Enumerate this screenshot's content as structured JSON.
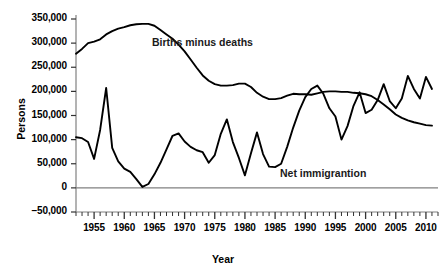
{
  "chart_data": {
    "type": "line",
    "title": "",
    "xlabel": "Year",
    "ylabel": "Persons",
    "xlim": [
      1952,
      2012
    ],
    "ylim": [
      -50000,
      350000
    ],
    "grid": false,
    "legend_position": "inline-annotations",
    "y_ticks": [
      -50000,
      0,
      50000,
      100000,
      150000,
      200000,
      250000,
      300000,
      350000
    ],
    "y_tick_labels": [
      "–50,000",
      "0",
      "50,000",
      "100,000",
      "150,000",
      "200,000",
      "250,000",
      "300,000",
      "350,000"
    ],
    "x_ticks": [
      1955,
      1960,
      1965,
      1970,
      1975,
      1980,
      1985,
      1990,
      1995,
      2000,
      2005,
      2010
    ],
    "x_tick_labels": [
      "1955",
      "1960",
      "1965",
      "1970",
      "1975",
      "1980",
      "1985",
      "1990",
      "1995",
      "2000",
      "2005",
      "2010"
    ],
    "x_minor_tick_interval": 1,
    "zero_line": 0,
    "line_color": "#000000",
    "zero_line_color": "#808080",
    "axis_color": "#808080",
    "series": [
      {
        "name": "Births minus deaths",
        "annotation": "Births minus deaths",
        "x": [
          1952,
          1953,
          1954,
          1955,
          1956,
          1957,
          1958,
          1959,
          1960,
          1961,
          1962,
          1963,
          1964,
          1965,
          1966,
          1967,
          1968,
          1969,
          1970,
          1971,
          1972,
          1973,
          1974,
          1975,
          1976,
          1977,
          1978,
          1979,
          1980,
          1981,
          1982,
          1983,
          1984,
          1985,
          1986,
          1987,
          1988,
          1989,
          1990,
          1991,
          1992,
          1993,
          1994,
          1995,
          1996,
          1997,
          1998,
          1999,
          2000,
          2001,
          2002,
          2003,
          2004,
          2005,
          2006,
          2007,
          2008,
          2009,
          2010,
          2011
        ],
        "values": [
          278000,
          288000,
          300000,
          303000,
          308000,
          318000,
          325000,
          330000,
          333000,
          337000,
          339000,
          340000,
          340000,
          336000,
          327000,
          318000,
          309000,
          297000,
          283000,
          266000,
          249000,
          233000,
          222000,
          215000,
          212000,
          212000,
          213000,
          216000,
          216000,
          209000,
          197000,
          189000,
          184000,
          184000,
          186000,
          191000,
          195000,
          194000,
          194000,
          193000,
          196000,
          199000,
          200000,
          200000,
          199000,
          199000,
          197000,
          196000,
          194000,
          190000,
          182000,
          173000,
          163000,
          152000,
          145000,
          140000,
          136000,
          133000,
          130000,
          129000
        ]
      },
      {
        "name": "Net immigration",
        "annotation": "Net immigrantion",
        "x": [
          1952,
          1953,
          1954,
          1955,
          1956,
          1957,
          1958,
          1959,
          1960,
          1961,
          1962,
          1963,
          1964,
          1965,
          1966,
          1967,
          1968,
          1969,
          1970,
          1971,
          1972,
          1973,
          1974,
          1975,
          1976,
          1977,
          1978,
          1979,
          1980,
          1981,
          1982,
          1983,
          1984,
          1985,
          1986,
          1987,
          1988,
          1989,
          1990,
          1991,
          1992,
          1993,
          1994,
          1995,
          1996,
          1997,
          1998,
          1999,
          2000,
          2001,
          2002,
          2003,
          2004,
          2005,
          2006,
          2007,
          2008,
          2009,
          2010,
          2011
        ],
        "values": [
          105000,
          103000,
          95000,
          60000,
          120000,
          207000,
          83000,
          55000,
          40000,
          33000,
          18000,
          2000,
          8000,
          28000,
          52000,
          80000,
          108000,
          113000,
          96000,
          85000,
          78000,
          74000,
          52000,
          68000,
          112000,
          142000,
          95000,
          62000,
          26000,
          72000,
          115000,
          70000,
          44000,
          43000,
          50000,
          85000,
          125000,
          160000,
          188000,
          205000,
          212000,
          195000,
          165000,
          148000,
          100000,
          128000,
          170000,
          198000,
          155000,
          162000,
          182000,
          215000,
          180000,
          165000,
          185000,
          232000,
          205000,
          185000,
          230000,
          205000
        ]
      }
    ]
  }
}
